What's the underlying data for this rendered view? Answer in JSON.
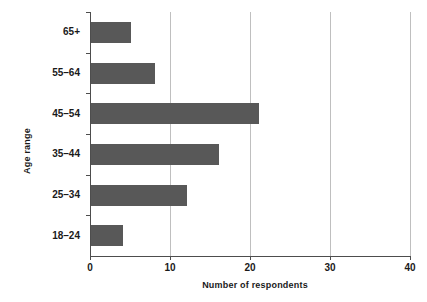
{
  "chart_data": {
    "type": "bar",
    "orientation": "horizontal",
    "title": "",
    "xlabel": "Number of respondents",
    "ylabel": "Age range",
    "categories": [
      "18–24",
      "25–34",
      "35–44",
      "45–54",
      "55–64",
      "65+"
    ],
    "values": [
      4,
      12,
      16,
      21,
      8,
      5
    ],
    "series": [
      {
        "name": "Number of respondents",
        "values": [
          4,
          12,
          16,
          21,
          8,
          5
        ]
      }
    ],
    "xlim": [
      0,
      40
    ],
    "xticks": [
      0,
      10,
      20,
      30,
      40
    ],
    "xtick_labels": [
      "0",
      "10",
      "20",
      "30",
      "40"
    ],
    "grid": "vertical",
    "legend": "none",
    "bar_color": "#585858",
    "grid_color": "#bfbfbf",
    "axis_color": "#4d4d4d",
    "background": "#ffffff"
  }
}
